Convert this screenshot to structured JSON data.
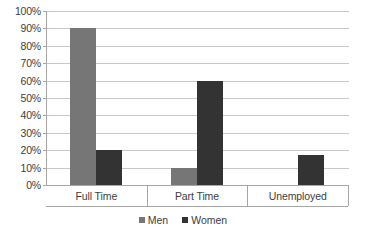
{
  "chart_data": {
    "type": "bar",
    "title": "",
    "subtitle": "",
    "xlabel": "",
    "ylabel": "",
    "categories": [
      "Full Time",
      "Part Time",
      "Unemployed"
    ],
    "series": [
      {
        "name": "Men",
        "color": "#767676",
        "values": [
          90,
          10,
          0
        ]
      },
      {
        "name": "Women",
        "color": "#333333",
        "values": [
          20,
          60,
          17
        ]
      }
    ],
    "ylim": [
      0,
      100
    ],
    "y_tick_step": 10,
    "y_tick_labels": [
      "100%",
      "90%",
      "80%",
      "70%",
      "60%",
      "50%",
      "40%",
      "30%",
      "20%",
      "10%",
      "0%"
    ],
    "y_tick_values": [
      100,
      90,
      80,
      70,
      60,
      50,
      40,
      30,
      20,
      10,
      0
    ],
    "grid": true,
    "grid_color": "#c9c9c9",
    "axis_color": "#a6a6a6",
    "legend_position": "bottom",
    "legend_entries": [
      "Men",
      "Women"
    ],
    "value_labels_shown": false,
    "background": "#ffffff"
  }
}
